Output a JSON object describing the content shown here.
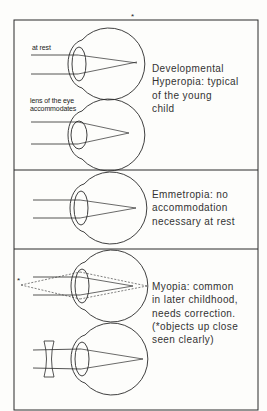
{
  "top_mark": "*",
  "panels": [
    {
      "id": "hyperopia",
      "labels": {
        "at_rest": "at rest",
        "accommodates_line1": "lens of the eye",
        "accommodates_line2": "accommodates"
      },
      "caption": [
        "Developmental",
        "Hyperopia: typical",
        "of the young",
        "child"
      ]
    },
    {
      "id": "emmetropia",
      "caption": [
        "Emmetropia: no",
        "accommodation",
        "necessary at rest"
      ]
    },
    {
      "id": "myopia",
      "near_object_marker": "*",
      "caption": [
        "Myopia: common",
        "in later childhood,",
        "needs correction.",
        "(*objects up close",
        "seen clearly)"
      ]
    }
  ],
  "colors": {
    "ink": "#2a2a2a",
    "paper": "#fdfdfb"
  }
}
